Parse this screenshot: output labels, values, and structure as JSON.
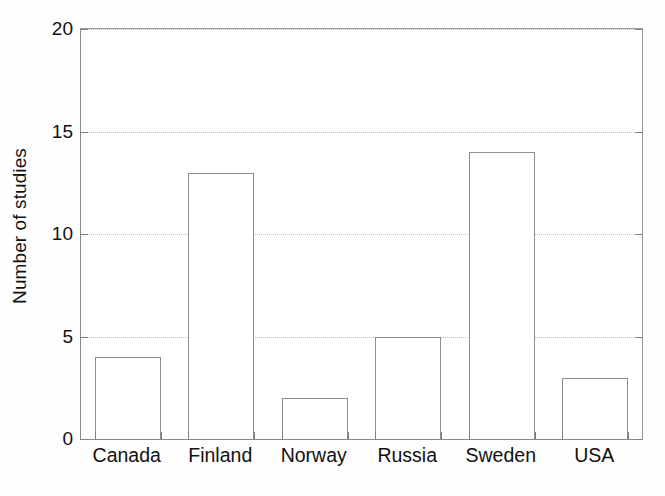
{
  "chart_data": {
    "type": "bar",
    "title": "",
    "subtitle": "",
    "xlabel": "",
    "ylabel": "Number of studies",
    "categories": [
      "Canada",
      "Finland",
      "Norway",
      "Russia",
      "Sweden",
      "USA"
    ],
    "values": [
      4,
      13,
      2,
      5,
      14,
      3
    ],
    "series": [
      {
        "name": "Number of studies",
        "values": [
          4,
          13,
          2,
          5,
          14,
          3
        ]
      }
    ],
    "ylim": [
      0,
      20
    ],
    "yticks": [
      0,
      5,
      10,
      15,
      20
    ],
    "ytick_labels": [
      "0",
      "5",
      "10",
      "15",
      "20"
    ],
    "grid": "horizontal-dotted",
    "legend": "none",
    "bar_style": "hollow-outline",
    "colors": {
      "bar_fill": "#ffffff",
      "bar_edge": "#8d8d8d",
      "axis": "#7d7d7d",
      "grid": "#b9b9b9",
      "text": "#111111",
      "background": "#ffffff"
    },
    "annotations": []
  }
}
